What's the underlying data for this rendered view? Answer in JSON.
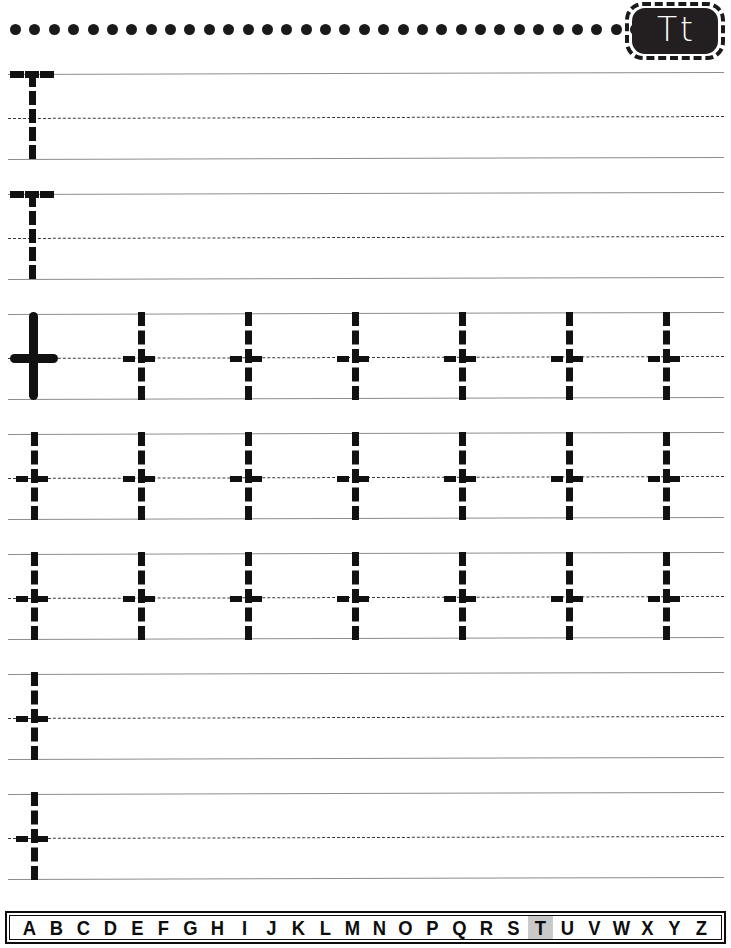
{
  "worksheet": {
    "title": "Letter T t handwriting tracing worksheet",
    "letter_badge": {
      "uppercase": "T",
      "lowercase": "t",
      "background_color": "#231f20",
      "text_color": "#ffffff",
      "border_style": "dashed"
    },
    "top_border": {
      "style": "dotted",
      "dot_count": 33,
      "dot_color": "#1a1a1a"
    },
    "line_colors": {
      "solid_rule": "#8d8d8d",
      "dashed_midline": "#3a3a3a",
      "trace_letter": "#111111"
    },
    "rows": [
      {
        "id": "row-1",
        "glyph": "T",
        "style": "dashed",
        "count": 1,
        "note": "uppercase T trace, left only"
      },
      {
        "id": "row-2",
        "glyph": "T",
        "style": "dashed",
        "count": 1,
        "note": "uppercase T trace, left only"
      },
      {
        "id": "row-3",
        "glyph": "t",
        "style": "model-plus-dashed",
        "count": 7,
        "note": "solid model t then six dashed t"
      },
      {
        "id": "row-4",
        "glyph": "t",
        "style": "dashed",
        "count": 7,
        "note": "seven dashed t"
      },
      {
        "id": "row-5",
        "glyph": "t",
        "style": "dashed",
        "count": 7,
        "note": "seven dashed t"
      },
      {
        "id": "row-6",
        "glyph": "t",
        "style": "dashed",
        "count": 1,
        "note": "single dashed t, free practice"
      },
      {
        "id": "row-7",
        "glyph": "t",
        "style": "dashed",
        "count": 1,
        "note": "single dashed t, free practice"
      }
    ],
    "alphabet_strip": {
      "letters": [
        "A",
        "B",
        "C",
        "D",
        "E",
        "F",
        "G",
        "H",
        "I",
        "J",
        "K",
        "L",
        "M",
        "N",
        "O",
        "P",
        "Q",
        "R",
        "S",
        "T",
        "U",
        "V",
        "W",
        "X",
        "Y",
        "Z"
      ],
      "highlighted_letter": "T",
      "highlight_color": "#c9c9c9",
      "text_color": "#0d0d0d"
    }
  }
}
